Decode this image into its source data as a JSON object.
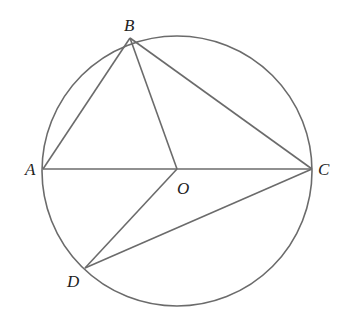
{
  "diagram": {
    "type": "geometry",
    "stroke_color": "#6b6b6b",
    "circle": {
      "center": "O",
      "cx": 177,
      "cy": 169,
      "r": 135
    },
    "points": {
      "A": {
        "x": 43,
        "y": 169,
        "label": "A"
      },
      "B": {
        "x": 130,
        "y": 38,
        "label": "B"
      },
      "C": {
        "x": 312,
        "y": 169,
        "label": "C"
      },
      "D": {
        "x": 85,
        "y": 268,
        "label": "D"
      },
      "O": {
        "x": 177,
        "y": 169,
        "label": "O"
      }
    },
    "segments": [
      "AB",
      "BO",
      "BC",
      "AC",
      "OD",
      "DC"
    ]
  }
}
